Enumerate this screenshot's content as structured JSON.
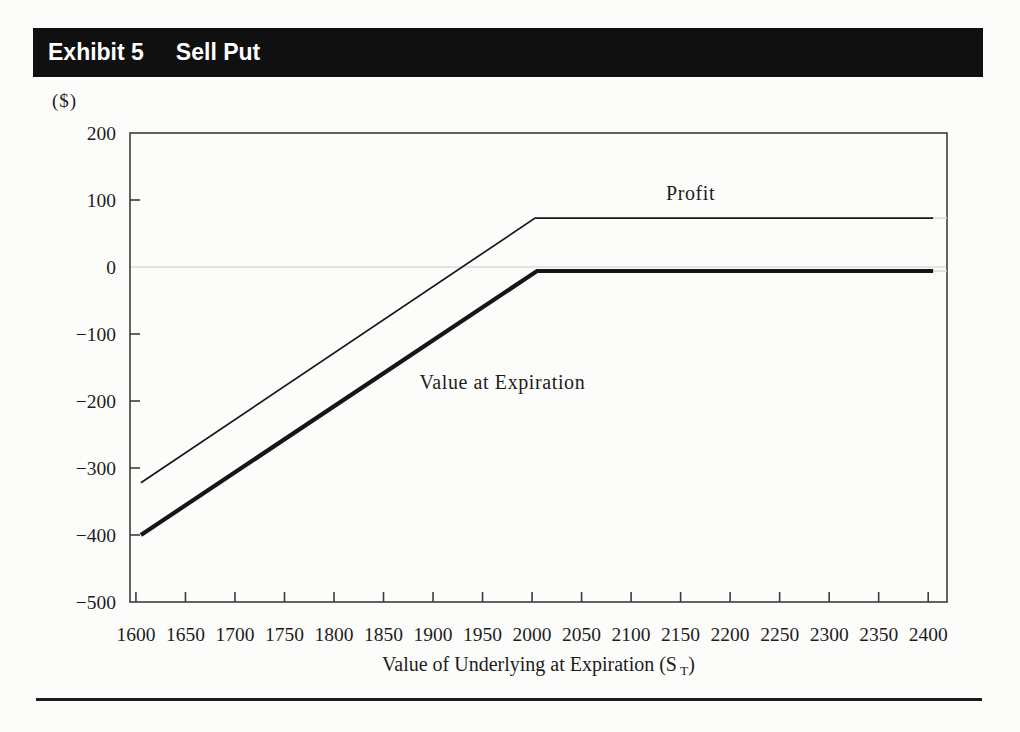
{
  "header": {
    "exhibit_label": "Exhibit 5",
    "title": "Sell Put"
  },
  "chart_data": {
    "type": "line",
    "title": "",
    "ylabel_unit": "($)",
    "xlabel_parts": {
      "prefix": "Value of Underlying at Expiration (S",
      "subscript": "T",
      "suffix": ")"
    },
    "xlim": [
      1594,
      2419
    ],
    "ylim": [
      -500,
      200
    ],
    "x_ticks": [
      1600,
      1650,
      1700,
      1750,
      1800,
      1850,
      1900,
      1950,
      2000,
      2050,
      2100,
      2150,
      2200,
      2250,
      2300,
      2350,
      2400
    ],
    "y_ticks": [
      {
        "v": 200,
        "label": "200"
      },
      {
        "v": 100,
        "label": "100"
      },
      {
        "v": 0,
        "label": "0"
      },
      {
        "v": -100,
        "label": "−100"
      },
      {
        "v": -200,
        "label": "−200"
      },
      {
        "v": -300,
        "label": "−300"
      },
      {
        "v": -400,
        "label": "−400"
      },
      {
        "v": -500,
        "label": "−500"
      }
    ],
    "y_tick_marks": [
      100,
      -100,
      -200,
      -300,
      -400
    ],
    "zero_gridline": true,
    "grid": "zero-line-only",
    "legend_position": "inline-labels",
    "series": [
      {
        "name": "Value at Expiration",
        "style": "thick",
        "points": [
          [
            1605,
            -400
          ],
          [
            2005,
            -6
          ],
          [
            2405,
            -6
          ]
        ],
        "fade_to_frame": true,
        "label": {
          "text": "Value at Expiration",
          "x": 1970,
          "y": -172,
          "anchor": "middle"
        }
      },
      {
        "name": "Profit",
        "style": "thin",
        "points": [
          [
            1605,
            -322
          ],
          [
            2003,
            73
          ],
          [
            2405,
            73
          ]
        ],
        "fade_to_frame": true,
        "label": {
          "text": "Profit",
          "x": 2160,
          "y": 110,
          "anchor": "middle"
        }
      }
    ]
  },
  "colors": {
    "page_bg": "#fcfcfb",
    "header_bg": "#101010",
    "header_text": "#ffffff",
    "axis": "#3c3c3c",
    "line": "#161616",
    "gridline": "#c9c9c9",
    "fade_line": "#d4d4d2"
  }
}
